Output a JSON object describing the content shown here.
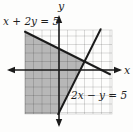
{
  "chart_data": {
    "type": "line",
    "title": "",
    "xlabel": "x",
    "ylabel": "y",
    "xlim": [
      -4,
      6.2
    ],
    "ylim": [
      -5.2,
      4.7
    ],
    "grid": true,
    "legend": "none",
    "series": [
      {
        "name": "x + 2y = 5",
        "equation": "x + 2y = 5",
        "slope": -0.5,
        "y_intercept": 2.5,
        "x_intercept": 5,
        "points": [
          [
            -4,
            4.5
          ],
          [
            0,
            2.5
          ],
          [
            3,
            1
          ],
          [
            5,
            0
          ],
          [
            6,
            -0.5
          ]
        ]
      },
      {
        "name": "2x − y = 5",
        "equation": "2x − y = 5",
        "slope": 2,
        "y_intercept": -5,
        "x_intercept": 2.5,
        "points": [
          [
            -0.1,
            -5.2
          ],
          [
            0,
            -5
          ],
          [
            2.5,
            0
          ],
          [
            3,
            1
          ],
          [
            4.9,
            4.8
          ]
        ]
      }
    ],
    "intersection_point": [
      3,
      1
    ],
    "shaded_region": {
      "vertices": [
        [
          -4,
          4.5
        ],
        [
          3,
          1
        ],
        [
          -0.09,
          -5.18
        ],
        [
          -4,
          -5.18
        ]
      ]
    }
  },
  "display": {
    "canvas": {
      "width": 133,
      "height": 132
    },
    "origin_px": {
      "x": 59,
      "y": 70
    },
    "unit_px": 8.5,
    "grid_box_px": {
      "left": 25,
      "top": 30,
      "right": 112,
      "bottom": 114
    },
    "x_axis_px": {
      "y": 70,
      "x1": 7,
      "x2": 122
    },
    "y_axis_px": {
      "x": 59,
      "y1": 15,
      "y2": 127
    },
    "arrow": {
      "length": 8,
      "half_width": 3.2
    },
    "label_positions_px": {
      "line1": {
        "x": 3,
        "y": 25
      },
      "line2": {
        "x": 71,
        "y": 99
      },
      "x_axis": {
        "x": 124,
        "y": 74
      },
      "y_axis": {
        "x": 61,
        "y": 10
      }
    },
    "colors": {
      "background": "#fdfdfc",
      "shade": "#b7b7b7",
      "grid": "rgba(0,0,0,0.20)",
      "axis": "#1b1b1b",
      "line": "#1b1b1b",
      "text": "#1f1f1f"
    }
  }
}
